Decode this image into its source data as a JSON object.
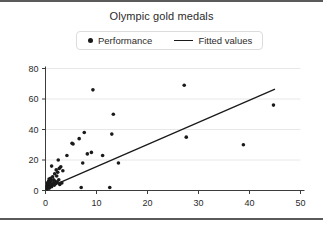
{
  "figure": {
    "title": "Olympic gold medals",
    "background": "#ffffff",
    "border_color": "#5a5a5a"
  },
  "legend": {
    "position": "top-center",
    "entries": [
      {
        "label": "Performance",
        "marker": "dot",
        "color": "#1a1a1a"
      },
      {
        "label": "Fitted values",
        "marker": "line",
        "color": "#1a1a1a"
      }
    ]
  },
  "chart_data": {
    "type": "scatter",
    "title": "Olympic gold medals",
    "xlabel": "",
    "ylabel": "",
    "xlim": [
      0,
      50
    ],
    "ylim": [
      0,
      80
    ],
    "xticks": [
      0,
      10,
      20,
      30,
      40,
      50
    ],
    "yticks": [
      0,
      20,
      40,
      60,
      80
    ],
    "grid": "horizontal",
    "marker_color": "#1a1a1a",
    "line_color": "#1a1a1a",
    "series": [
      {
        "name": "Performance",
        "type": "scatter",
        "points": [
          [
            0.3,
            1.0
          ],
          [
            0.3,
            2.5
          ],
          [
            0.4,
            3.5
          ],
          [
            0.4,
            5.0
          ],
          [
            0.5,
            2.0
          ],
          [
            0.5,
            4.0
          ],
          [
            0.6,
            6.0
          ],
          [
            0.6,
            3.0
          ],
          [
            0.7,
            1.5
          ],
          [
            0.7,
            7.5
          ],
          [
            0.8,
            4.5
          ],
          [
            0.8,
            2.0
          ],
          [
            0.9,
            5.5
          ],
          [
            1.0,
            3.0
          ],
          [
            1.0,
            8.0
          ],
          [
            1.1,
            6.5
          ],
          [
            1.2,
            2.5
          ],
          [
            1.2,
            16.0
          ],
          [
            1.3,
            4.0
          ],
          [
            1.4,
            9.0
          ],
          [
            1.5,
            5.0
          ],
          [
            1.6,
            7.0
          ],
          [
            1.7,
            3.5
          ],
          [
            1.8,
            11.0
          ],
          [
            1.9,
            6.0
          ],
          [
            2.0,
            4.5
          ],
          [
            2.1,
            13.5
          ],
          [
            2.2,
            9.5
          ],
          [
            2.3,
            5.5
          ],
          [
            2.4,
            12.0
          ],
          [
            2.5,
            20.0
          ],
          [
            2.6,
            7.0
          ],
          [
            2.7,
            14.5
          ],
          [
            2.8,
            4.0
          ],
          [
            3.0,
            15.5
          ],
          [
            3.2,
            5.0
          ],
          [
            3.4,
            13.0
          ],
          [
            4.2,
            23.0
          ],
          [
            5.2,
            31.0
          ],
          [
            5.4,
            30.5
          ],
          [
            6.6,
            34.0
          ],
          [
            7.0,
            2.0
          ],
          [
            7.3,
            18.0
          ],
          [
            7.6,
            38.0
          ],
          [
            8.2,
            24.0
          ],
          [
            9.0,
            25.0
          ],
          [
            9.3,
            66.0
          ],
          [
            11.2,
            23.0
          ],
          [
            12.6,
            2.0
          ],
          [
            13.0,
            37.0
          ],
          [
            13.3,
            50.0
          ],
          [
            14.3,
            18.0
          ],
          [
            27.2,
            69.0
          ],
          [
            27.6,
            35.0
          ],
          [
            38.8,
            30.0
          ],
          [
            44.7,
            56.0
          ]
        ]
      },
      {
        "name": "Fitted values",
        "type": "line",
        "endpoints": [
          [
            2.0,
            4.0
          ],
          [
            45.0,
            66.5
          ]
        ]
      }
    ]
  }
}
